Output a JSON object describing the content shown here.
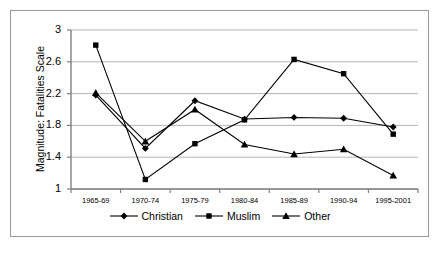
{
  "chart_data": {
    "type": "line",
    "title": "",
    "xlabel": "",
    "ylabel": "Magnitude: Fatalities Scale",
    "categories": [
      "1965-69",
      "1970-74",
      "1975-79",
      "1980-84",
      "1985-89",
      "1990-94",
      "1995-2001"
    ],
    "ylim": [
      1,
      3
    ],
    "yticks": [
      "1",
      "1.4",
      "1.8",
      "2.2",
      "2.6",
      "3"
    ],
    "ytick_values": [
      1,
      1.4,
      1.8,
      2.2,
      2.6,
      3
    ],
    "grid": "horizontal",
    "legend_position": "bottom-center",
    "series": [
      {
        "name": "Christian",
        "marker": "diamond",
        "color": "#000000",
        "values": [
          2.18,
          1.51,
          2.11,
          1.88,
          1.9,
          1.89,
          1.78
        ]
      },
      {
        "name": "Muslim",
        "marker": "square",
        "color": "#000000",
        "values": [
          2.81,
          1.12,
          1.57,
          1.87,
          2.63,
          2.45,
          1.69
        ]
      },
      {
        "name": "Other",
        "marker": "triangle",
        "color": "#000000",
        "values": [
          2.21,
          1.6,
          2.0,
          1.56,
          1.44,
          1.5,
          1.17
        ]
      }
    ]
  },
  "style": {
    "frame_color": "#9a9a9a",
    "grid_color": "#b4b4b4",
    "axis_color": "#808080",
    "line_color": "#000000"
  }
}
